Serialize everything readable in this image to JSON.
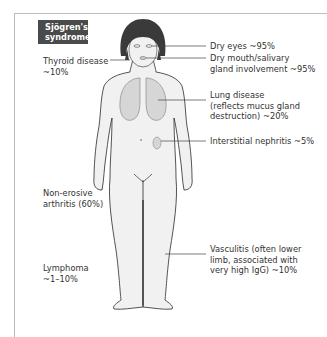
{
  "title": [
    "Sjögren's",
    "syndrome"
  ],
  "labels": {
    "dry_eyes": [
      "Dry eyes ~95%"
    ],
    "dry_mouth": [
      "Dry mouth/salivary",
      "gland involvement ~95%"
    ],
    "lung": [
      "Lung disease",
      "(reflects mucus gland",
      "destruction) ~20%"
    ],
    "nephritis": [
      "Interstitial nephritis ~5%"
    ],
    "vasculitis": [
      "Vasculitis (often lower",
      "limb, associated with",
      "very high IgG) ~10%"
    ],
    "thyroid": [
      "Thyroid disease",
      "~10%"
    ],
    "arthritis": [
      "Non-erosive",
      "arthritis (60%)"
    ],
    "lymphoma": [
      "Lymphoma",
      "~1–10%"
    ]
  },
  "colors": {
    "title_bg": "#4a4a4a",
    "title_text": "#ffffff",
    "body_fill": "#f1f1f1",
    "organ_fill": "#d6d6d6",
    "outline": "#2a2a2a",
    "frame": "#bdbdbd"
  }
}
